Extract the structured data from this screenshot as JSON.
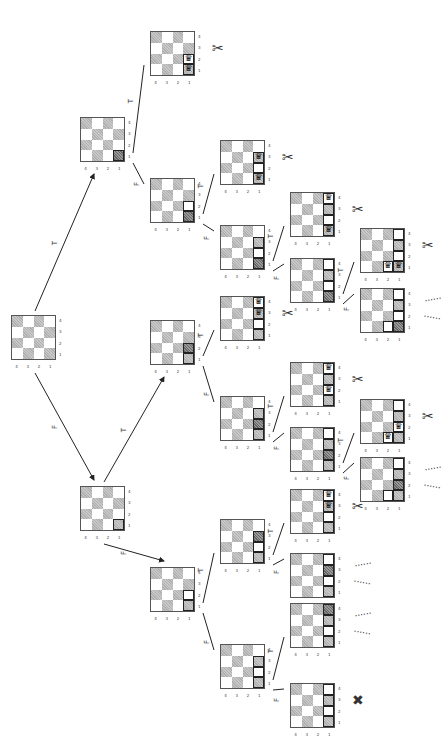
{
  "diagram": {
    "type": "search-tree",
    "row_labels": [
      "4",
      "3",
      "2",
      "1"
    ],
    "col_labels": [
      "4",
      "3",
      "2",
      "1"
    ],
    "symbols": {
      "pruned": "✂",
      "fail": "✖",
      "continue": "......"
    },
    "edge_labels": {
      "true": "T",
      "false": "F"
    }
  },
  "nodes": [
    {
      "id": "root",
      "x": 11,
      "y": 315,
      "cells": [],
      "outcome": ""
    },
    {
      "id": "T",
      "x": 80,
      "y": 117,
      "cells": [
        {
          "r": 3,
          "c": 3,
          "k": "conflict"
        }
      ],
      "outcome": ""
    },
    {
      "id": "F",
      "x": 80,
      "y": 486,
      "cells": [
        {
          "r": 3,
          "c": 3,
          "k": "hl"
        }
      ],
      "outcome": ""
    },
    {
      "id": "TT",
      "x": 150,
      "y": 31,
      "cells": [
        {
          "r": 2,
          "c": 3,
          "k": "queen"
        },
        {
          "r": 3,
          "c": 3,
          "k": "queen"
        }
      ],
      "outcome": "pruned"
    },
    {
      "id": "TF",
      "x": 150,
      "y": 178,
      "cells": [
        {
          "r": 2,
          "c": 3,
          "k": "hl"
        },
        {
          "r": 3,
          "c": 3,
          "k": "conflict"
        }
      ],
      "outcome": ""
    },
    {
      "id": "TFT",
      "x": 220,
      "y": 140,
      "cells": [
        {
          "r": 1,
          "c": 3,
          "k": "queen"
        },
        {
          "r": 2,
          "c": 3,
          "k": "hl"
        },
        {
          "r": 3,
          "c": 3,
          "k": "queen"
        }
      ],
      "outcome": "pruned"
    },
    {
      "id": "TFF",
      "x": 220,
      "y": 225,
      "cells": [
        {
          "r": 1,
          "c": 3,
          "k": "hl"
        },
        {
          "r": 2,
          "c": 3,
          "k": "hl"
        },
        {
          "r": 3,
          "c": 3,
          "k": "conflict"
        }
      ],
      "outcome": ""
    },
    {
      "id": "TFFT",
      "x": 290,
      "y": 192,
      "cells": [
        {
          "r": 0,
          "c": 3,
          "k": "queen"
        },
        {
          "r": 1,
          "c": 3,
          "k": "hl"
        },
        {
          "r": 2,
          "c": 3,
          "k": "hl"
        },
        {
          "r": 3,
          "c": 3,
          "k": "queen"
        }
      ],
      "outcome": "pruned"
    },
    {
      "id": "TFFF",
      "x": 290,
      "y": 258,
      "cells": [
        {
          "r": 0,
          "c": 3,
          "k": "hl"
        },
        {
          "r": 1,
          "c": 3,
          "k": "hl"
        },
        {
          "r": 2,
          "c": 3,
          "k": "hl"
        },
        {
          "r": 3,
          "c": 3,
          "k": "conflict"
        }
      ],
      "outcome": ""
    },
    {
      "id": "TFFFT",
      "x": 360,
      "y": 228,
      "cells": [
        {
          "r": 0,
          "c": 3,
          "k": "hl"
        },
        {
          "r": 1,
          "c": 3,
          "k": "hl"
        },
        {
          "r": 2,
          "c": 3,
          "k": "hl"
        },
        {
          "r": 3,
          "c": 2,
          "k": "queen"
        },
        {
          "r": 3,
          "c": 3,
          "k": "queen"
        }
      ],
      "outcome": "pruned"
    },
    {
      "id": "TFFFF",
      "x": 360,
      "y": 288,
      "cells": [
        {
          "r": 0,
          "c": 3,
          "k": "hl"
        },
        {
          "r": 1,
          "c": 3,
          "k": "hl"
        },
        {
          "r": 2,
          "c": 3,
          "k": "hl"
        },
        {
          "r": 3,
          "c": 2,
          "k": "hl"
        },
        {
          "r": 3,
          "c": 3,
          "k": "conflict"
        }
      ],
      "outcome": "continue"
    },
    {
      "id": "FT",
      "x": 150,
      "y": 320,
      "cells": [
        {
          "r": 2,
          "c": 3,
          "k": "conflict"
        },
        {
          "r": 3,
          "c": 3,
          "k": "hl"
        }
      ],
      "outcome": ""
    },
    {
      "id": "FF",
      "x": 150,
      "y": 567,
      "cells": [
        {
          "r": 2,
          "c": 3,
          "k": "hl"
        },
        {
          "r": 3,
          "c": 3,
          "k": "hl"
        }
      ],
      "outcome": ""
    },
    {
      "id": "FTT",
      "x": 220,
      "y": 296,
      "cells": [
        {
          "r": 0,
          "c": 3,
          "k": "queen"
        },
        {
          "r": 1,
          "c": 3,
          "k": "queen"
        },
        {
          "r": 2,
          "c": 3,
          "k": "hl"
        },
        {
          "r": 3,
          "c": 3,
          "k": "hl"
        }
      ],
      "outcome": "pruned"
    },
    {
      "id": "FTF",
      "x": 220,
      "y": 396,
      "cells": [
        {
          "r": 1,
          "c": 3,
          "k": "hl"
        },
        {
          "r": 2,
          "c": 3,
          "k": "conflict"
        },
        {
          "r": 3,
          "c": 3,
          "k": "hl"
        }
      ],
      "outcome": ""
    },
    {
      "id": "FTFT",
      "x": 290,
      "y": 362,
      "cells": [
        {
          "r": 0,
          "c": 3,
          "k": "queen"
        },
        {
          "r": 1,
          "c": 3,
          "k": "hl"
        },
        {
          "r": 2,
          "c": 3,
          "k": "queen"
        },
        {
          "r": 3,
          "c": 3,
          "k": "hl"
        }
      ],
      "outcome": "pruned"
    },
    {
      "id": "FTFF",
      "x": 290,
      "y": 427,
      "cells": [
        {
          "r": 0,
          "c": 3,
          "k": "hl"
        },
        {
          "r": 1,
          "c": 3,
          "k": "hl"
        },
        {
          "r": 2,
          "c": 3,
          "k": "conflict"
        },
        {
          "r": 3,
          "c": 3,
          "k": "hl"
        }
      ],
      "outcome": ""
    },
    {
      "id": "FTFFT",
      "x": 360,
      "y": 399,
      "cells": [
        {
          "r": 0,
          "c": 3,
          "k": "hl"
        },
        {
          "r": 1,
          "c": 3,
          "k": "hl"
        },
        {
          "r": 2,
          "c": 3,
          "k": "queen"
        },
        {
          "r": 3,
          "c": 2,
          "k": "queen"
        },
        {
          "r": 3,
          "c": 3,
          "k": "hl"
        }
      ],
      "outcome": "pruned"
    },
    {
      "id": "FTFFF",
      "x": 360,
      "y": 457,
      "cells": [
        {
          "r": 0,
          "c": 3,
          "k": "hl"
        },
        {
          "r": 1,
          "c": 3,
          "k": "hl"
        },
        {
          "r": 2,
          "c": 3,
          "k": "conflict"
        },
        {
          "r": 3,
          "c": 2,
          "k": "hl"
        },
        {
          "r": 3,
          "c": 3,
          "k": "hl"
        }
      ],
      "outcome": "continue"
    },
    {
      "id": "FFT",
      "x": 220,
      "y": 519,
      "cells": [
        {
          "r": 1,
          "c": 3,
          "k": "conflict"
        },
        {
          "r": 2,
          "c": 3,
          "k": "hl"
        },
        {
          "r": 3,
          "c": 3,
          "k": "hl"
        }
      ],
      "outcome": ""
    },
    {
      "id": "FFF",
      "x": 220,
      "y": 644,
      "cells": [
        {
          "r": 1,
          "c": 3,
          "k": "hl"
        },
        {
          "r": 2,
          "c": 3,
          "k": "hl"
        },
        {
          "r": 3,
          "c": 3,
          "k": "hl"
        }
      ],
      "outcome": ""
    },
    {
      "id": "FFTT",
      "x": 290,
      "y": 489,
      "cells": [
        {
          "r": 0,
          "c": 3,
          "k": "queen"
        },
        {
          "r": 1,
          "c": 3,
          "k": "queen"
        },
        {
          "r": 2,
          "c": 3,
          "k": "hl"
        },
        {
          "r": 3,
          "c": 3,
          "k": "hl"
        }
      ],
      "outcome": "pruned"
    },
    {
      "id": "FFTF",
      "x": 290,
      "y": 553,
      "cells": [
        {
          "r": 0,
          "c": 3,
          "k": "hl"
        },
        {
          "r": 1,
          "c": 3,
          "k": "conflict"
        },
        {
          "r": 2,
          "c": 3,
          "k": "hl"
        },
        {
          "r": 3,
          "c": 3,
          "k": "hl"
        }
      ],
      "outcome": "continue"
    },
    {
      "id": "FFFT",
      "x": 290,
      "y": 603,
      "cells": [
        {
          "r": 0,
          "c": 3,
          "k": "conflict"
        },
        {
          "r": 1,
          "c": 3,
          "k": "hl"
        },
        {
          "r": 2,
          "c": 3,
          "k": "hl"
        },
        {
          "r": 3,
          "c": 3,
          "k": "hl"
        }
      ],
      "outcome": "continue"
    },
    {
      "id": "FFFF",
      "x": 290,
      "y": 683,
      "cells": [
        {
          "r": 0,
          "c": 3,
          "k": "hl"
        },
        {
          "r": 1,
          "c": 3,
          "k": "hl"
        },
        {
          "r": 2,
          "c": 3,
          "k": "hl"
        },
        {
          "r": 3,
          "c": 3,
          "k": "hl"
        }
      ],
      "outcome": "fail"
    }
  ],
  "edges": [
    {
      "from": "root",
      "to": "T",
      "label": "T",
      "arrow": true
    },
    {
      "from": "root",
      "to": "F",
      "label": "F",
      "arrow": true
    },
    {
      "from": "F",
      "to": "FT",
      "label": "T",
      "arrow": true
    },
    {
      "from": "F",
      "to": "FF",
      "label": "F",
      "arrow": true
    },
    {
      "from": "T",
      "to": "TT",
      "label": "T"
    },
    {
      "from": "T",
      "to": "TF",
      "label": "F"
    },
    {
      "from": "TF",
      "to": "TFT",
      "label": "T"
    },
    {
      "from": "TF",
      "to": "TFF",
      "label": "F"
    },
    {
      "from": "TFF",
      "to": "TFFT",
      "label": "T"
    },
    {
      "from": "TFF",
      "to": "TFFF",
      "label": "F"
    },
    {
      "from": "TFFF",
      "to": "TFFFT",
      "label": "T"
    },
    {
      "from": "TFFF",
      "to": "TFFFF",
      "label": "F"
    },
    {
      "from": "FT",
      "to": "FTT",
      "label": "T"
    },
    {
      "from": "FT",
      "to": "FTF",
      "label": "F"
    },
    {
      "from": "FTF",
      "to": "FTFT",
      "label": "T"
    },
    {
      "from": "FTF",
      "to": "FTFF",
      "label": "F"
    },
    {
      "from": "FTFF",
      "to": "FTFFT",
      "label": "T"
    },
    {
      "from": "FTFF",
      "to": "FTFFF",
      "label": "F"
    },
    {
      "from": "FF",
      "to": "FFT",
      "label": "T"
    },
    {
      "from": "FF",
      "to": "FFF",
      "label": "F"
    },
    {
      "from": "FFT",
      "to": "FFTT",
      "label": "T"
    },
    {
      "from": "FFT",
      "to": "FFTF",
      "label": "F"
    },
    {
      "from": "FFF",
      "to": "FFFT",
      "label": "T"
    },
    {
      "from": "FFF",
      "to": "FFFF",
      "label": "F"
    }
  ]
}
